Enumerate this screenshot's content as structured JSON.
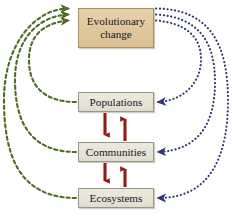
{
  "diagram": {
    "width": 232,
    "height": 220,
    "background": "#ffffff",
    "boxes": [
      {
        "id": "evolutionary-change",
        "label": "Evolutionary\nchange",
        "fill": "#e0c69c",
        "border": "#a98f66",
        "x": 78,
        "y": 8,
        "w": 76,
        "h": 40
      },
      {
        "id": "populations",
        "label": "Populations",
        "fill": "#e6e4d6",
        "border": "#9a9684",
        "x": 78,
        "y": 92,
        "w": 76,
        "h": 20
      },
      {
        "id": "communities",
        "label": "Communities",
        "fill": "#e6e4d6",
        "border": "#9a9684",
        "x": 78,
        "y": 142,
        "w": 76,
        "h": 20
      },
      {
        "id": "ecosystems",
        "label": "Ecosystems",
        "fill": "#e6e4d6",
        "border": "#9a9684",
        "x": 78,
        "y": 188,
        "w": 76,
        "h": 20
      }
    ],
    "connectors": {
      "green": {
        "color": "#4d6b22",
        "style": "dashed",
        "label": "ecological level influences evolutionary change",
        "direction": "up-to-evolutionary-change",
        "count": 3,
        "paths": [
          "M 76,102 C 44,102 28,84 28,58 C 28,32 44,22 68,20",
          "M 76,152 C 28,152 14,120 14,80 C 14,40 36,16 68,14",
          "M 76,198 C 16,198 3,150 3,100 C 3,44 34,8 68,8"
        ]
      },
      "blue": {
        "color": "#2f3673",
        "style": "dotted",
        "label": "evolutionary change influences ecological level",
        "direction": "down-from-evolutionary-change",
        "count": 3,
        "paths": [
          "M 156,20 C 186,22 200,36 200,58 C 200,82 184,100 158,102",
          "M 156,14 C 200,16 216,42 216,82 C 216,122 200,150 158,152",
          "M 156,8 C 212,8 229,46 229,100 C 229,152 214,198 158,198"
        ]
      },
      "red": {
        "color": "#8e1b16",
        "style": "solid",
        "label": "bidirectional ecological interactions",
        "pairs": [
          {
            "from": "populations",
            "to": "communities"
          },
          {
            "from": "communities",
            "to": "ecosystems"
          }
        ]
      }
    }
  }
}
